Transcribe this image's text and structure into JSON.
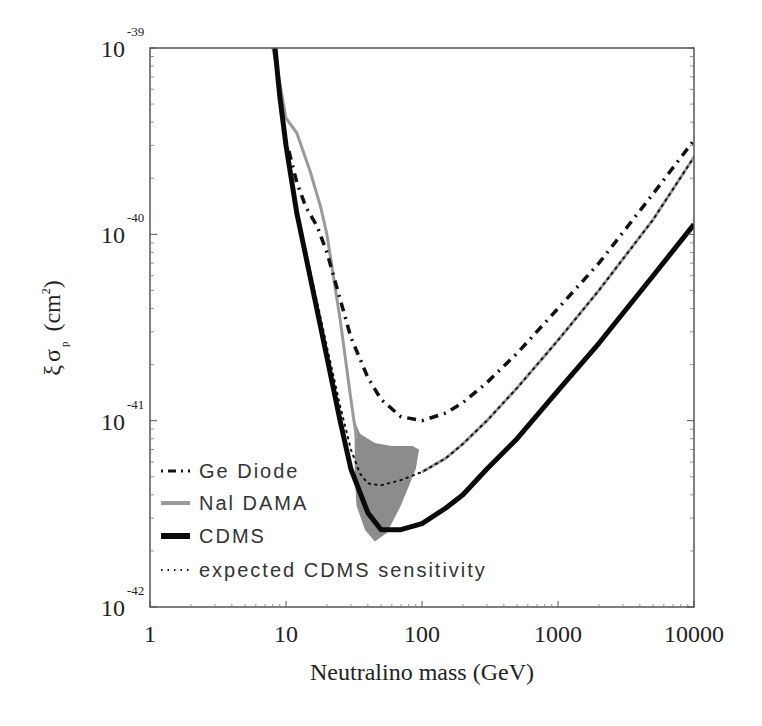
{
  "chart_data": {
    "type": "line",
    "title": "",
    "xlabel": "Neutralino mass (GeV)",
    "ylabel": "ξ σ_p (cm²)",
    "ylabel_parts": {
      "xi": "ξ",
      "sigma": "σ",
      "sub": "p",
      "unit_open": "(cm",
      "unit_sup": "2",
      "unit_close": ")"
    },
    "xscale": "log",
    "yscale": "log",
    "xlim": [
      1,
      10000
    ],
    "ylim": [
      1e-42,
      1e-39
    ],
    "grid": false,
    "legend_position": "lower left",
    "x_ticks": [
      {
        "value": 1,
        "label": "1"
      },
      {
        "value": 10,
        "label": "10"
      },
      {
        "value": 100,
        "label": "100"
      },
      {
        "value": 1000,
        "label": "1000"
      },
      {
        "value": 10000,
        "label": "10000"
      }
    ],
    "y_ticks": [
      {
        "value": 1e-39,
        "base": "10",
        "exp": "-39"
      },
      {
        "value": 1e-40,
        "base": "10",
        "exp": "-40"
      },
      {
        "value": 1e-41,
        "base": "10",
        "exp": "-41"
      },
      {
        "value": 1e-42,
        "base": "10",
        "exp": "-42"
      }
    ],
    "series": [
      {
        "name": "Ge Diode",
        "style": "dash-dot",
        "color": "#111111",
        "x": [
          10.5,
          12,
          14,
          17,
          20,
          25,
          30,
          40,
          50,
          70,
          100,
          150,
          200,
          300,
          500,
          1000,
          2000,
          5000,
          10000
        ],
        "y": [
          2.8e-40,
          1.9e-40,
          1.4e-40,
          1.1e-40,
          8e-41,
          4.5e-41,
          2.8e-41,
          1.7e-41,
          1.3e-41,
          1.05e-41,
          1e-41,
          1.1e-41,
          1.25e-41,
          1.6e-41,
          2.3e-41,
          4e-41,
          7e-41,
          1.65e-40,
          3.2e-40
        ]
      },
      {
        "name": "NaI DAMA",
        "legend_label": "Nal DAMA",
        "style": "solid",
        "color": "#9a9a9a",
        "x": [
          8.0,
          9,
          10,
          12,
          15,
          18,
          20,
          25,
          30,
          33
        ],
        "y": [
          1e-39,
          6.5e-40,
          4.2e-40,
          3.5e-40,
          2.2e-40,
          1.4e-40,
          1e-40,
          3.5e-41,
          1.3e-41,
          8e-42
        ]
      },
      {
        "name": "CDMS",
        "style": "solid-thick",
        "color": "#0a0a0a",
        "x": [
          8.3,
          9,
          10,
          12,
          15,
          20,
          25,
          30,
          40,
          50,
          70,
          100,
          150,
          200,
          300,
          500,
          1000,
          2000,
          5000,
          10000
        ],
        "y": [
          1e-39,
          5.5e-40,
          3e-40,
          1.3e-40,
          6e-41,
          2.2e-41,
          1e-41,
          5.5e-42,
          3.2e-42,
          2.6e-42,
          2.6e-42,
          2.8e-42,
          3.4e-42,
          4e-42,
          5.5e-42,
          8e-42,
          1.45e-41,
          2.6e-41,
          6e-41,
          1.13e-40
        ]
      },
      {
        "name": "expected CDMS sensitivity",
        "style": "dotted",
        "color": "#111111",
        "x": [
          13,
          15,
          20,
          25,
          30,
          35,
          40,
          50,
          70,
          100,
          150,
          200,
          300,
          500,
          1000,
          2000,
          5000,
          10000
        ],
        "y": [
          1e-40,
          6.5e-41,
          2.5e-41,
          1.2e-41,
          7e-42,
          5.2e-42,
          4.6e-42,
          4.5e-42,
          4.8e-42,
          5.3e-42,
          6.3e-42,
          7.5e-42,
          1e-41,
          1.5e-41,
          2.7e-41,
          5e-41,
          1.2e-40,
          2.6e-40
        ]
      },
      {
        "name": "NaI DAMA upper (continues)",
        "legend_label": null,
        "style": "solid",
        "color": "#9a9a9a",
        "x": [
          100,
          150,
          200,
          300,
          500,
          1000,
          2000,
          5000,
          10000
        ],
        "y": [
          5.3e-42,
          6.3e-42,
          7.5e-42,
          1e-41,
          1.5e-41,
          2.7e-41,
          5e-41,
          1.2e-40,
          2.6e-40
        ]
      }
    ],
    "regions": [
      {
        "name": "DAMA annual modulation allowed region",
        "color": "#8c8c8c",
        "polygon": [
          [
            32,
            1e-41
          ],
          [
            35,
            8.5e-42
          ],
          [
            45,
            7.6e-42
          ],
          [
            60,
            7.3e-42
          ],
          [
            85,
            7.3e-42
          ],
          [
            95,
            7e-42
          ],
          [
            90,
            5.5e-42
          ],
          [
            70,
            3.5e-42
          ],
          [
            55,
            2.5e-42
          ],
          [
            45,
            2.25e-42
          ],
          [
            38,
            2.6e-42
          ],
          [
            33,
            3.5e-42
          ],
          [
            32,
            5e-42
          ]
        ]
      }
    ],
    "legend": [
      {
        "label": "Ge Diode",
        "style": "dash-dot"
      },
      {
        "label": "Nal DAMA",
        "style": "gray"
      },
      {
        "label": "CDMS",
        "style": "thick"
      },
      {
        "label": "expected CDMS sensitivity",
        "style": "dotted"
      }
    ]
  }
}
